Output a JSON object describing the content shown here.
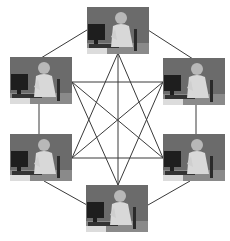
{
  "diagram": {
    "nodes": [
      {
        "id": "top",
        "label": "User at computer (top)"
      },
      {
        "id": "upper-left",
        "label": "User at computer (upper left)"
      },
      {
        "id": "upper-right",
        "label": "User at computer (upper right)"
      },
      {
        "id": "lower-left",
        "label": "User at computer (lower left)"
      },
      {
        "id": "lower-right",
        "label": "User at computer (lower right)"
      },
      {
        "id": "bottom",
        "label": "User at computer (bottom)"
      }
    ],
    "line_color": "#3a3a3a",
    "background_color": "#ffffff",
    "photo_background": "#6a6a6a"
  }
}
